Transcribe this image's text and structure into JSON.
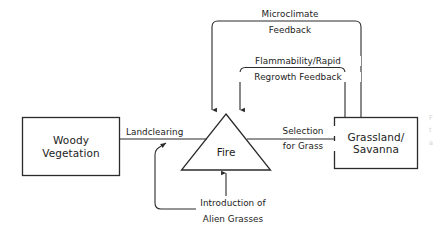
{
  "diagram": {
    "background_color": "#ffffff",
    "stroke_color": "#2b2b2b",
    "text_color": "#1c1c1c",
    "nodes": [
      {
        "id": "woody-vegetation",
        "shape": "rectangle",
        "line1": "Woody",
        "line2": "Vegetation"
      },
      {
        "id": "fire",
        "shape": "triangle",
        "line1": "Fire",
        "line2": ""
      },
      {
        "id": "grassland-savanna",
        "shape": "rectangle",
        "line1": "Grassland/",
        "line2": "Savanna"
      },
      {
        "id": "alien-grasses",
        "shape": "text",
        "line1": "Introduction of",
        "line2": "Alien Grasses"
      }
    ],
    "edges": [
      {
        "id": "landclearing",
        "from": "woody-vegetation",
        "to": "fire",
        "line1": "Landclearing",
        "line2": ""
      },
      {
        "id": "selection-for-grass",
        "from": "fire",
        "to": "grassland-savanna",
        "line1": "Selection",
        "line2": "for Grass"
      },
      {
        "id": "microclimate-feedback",
        "from": "grassland-savanna",
        "to": "fire",
        "line1": "Microclimate",
        "line2": "Feedback"
      },
      {
        "id": "flammability-regrowth-feedback",
        "from": "grassland-savanna",
        "to": "fire",
        "line1": "Flammability/Rapid",
        "line2": "Regrowth Feedback"
      }
    ],
    "margin_note": {
      "line1": "F",
      "line2": "t",
      "line3": "a"
    }
  }
}
